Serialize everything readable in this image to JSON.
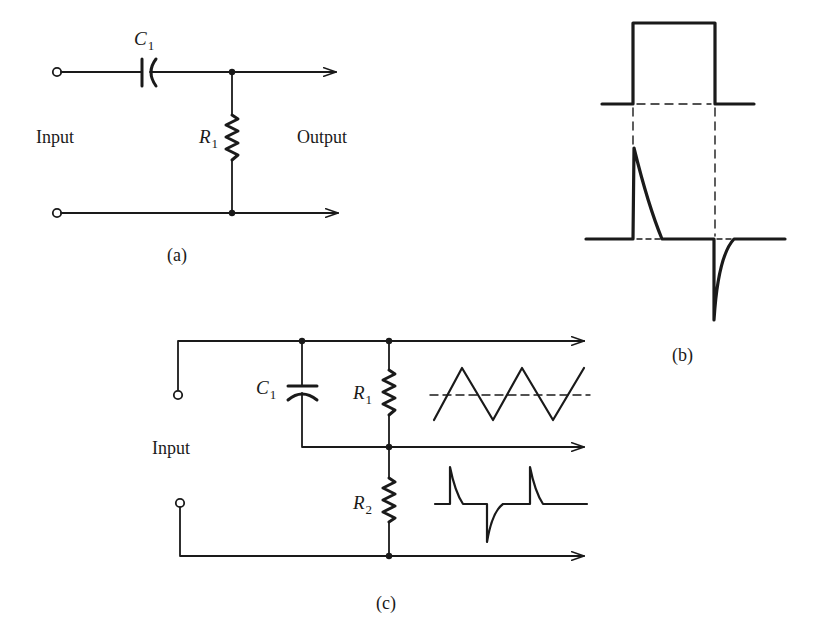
{
  "figure": {
    "panel_a": {
      "caption": "(a)",
      "input_label": "Input",
      "output_label": "Output",
      "capacitor": {
        "symbol": "C",
        "subscript": "1"
      },
      "resistor": {
        "symbol": "R",
        "subscript": "1"
      }
    },
    "panel_b": {
      "caption": "(b)",
      "waveforms": [
        "square-pulse-input",
        "differentiated-spike-output"
      ]
    },
    "panel_c": {
      "caption": "(c)",
      "input_label": "Input",
      "capacitor": {
        "symbol": "C",
        "subscript": "1"
      },
      "resistor_1": {
        "symbol": "R",
        "subscript": "1"
      },
      "resistor_2": {
        "symbol": "R",
        "subscript": "2"
      },
      "waveforms": [
        "triangle-wave-across-R1",
        "spike-train-across-R2"
      ]
    },
    "colors": {
      "ink": "#1a1a1a",
      "background": "#ffffff"
    }
  }
}
